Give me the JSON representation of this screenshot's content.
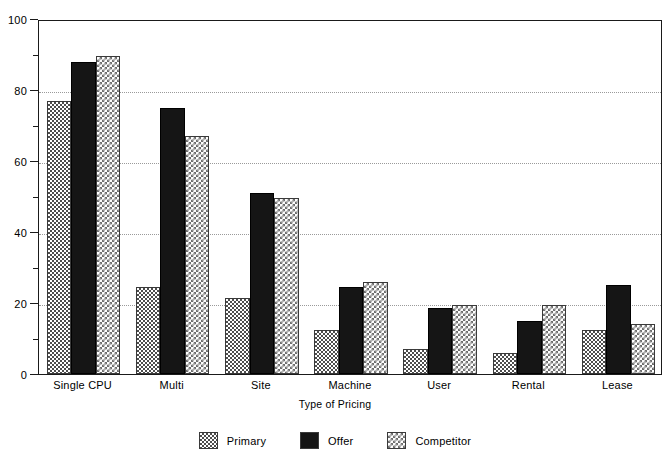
{
  "chart_data": {
    "type": "bar",
    "title": "",
    "xlabel": "Type of Pricing",
    "ylabel": "",
    "categories": [
      "Single CPU",
      "Multi",
      "Site",
      "Machine",
      "User",
      "Rental",
      "Lease"
    ],
    "series": [
      {
        "name": "Primary",
        "pattern": "cross-hatch",
        "color": "#4d4d4d",
        "values": [
          77,
          24.5,
          21.5,
          12.5,
          7,
          6,
          12.5
        ]
      },
      {
        "name": "Offer",
        "pattern": "solid",
        "color": "#151515",
        "values": [
          88,
          75,
          51,
          24.5,
          18.5,
          15,
          25
        ]
      },
      {
        "name": "Competitor",
        "pattern": "diagonal-hatch",
        "color": "#6f6f6f",
        "values": [
          89.5,
          67,
          49.5,
          26,
          19.5,
          19.5,
          14
        ]
      }
    ],
    "ylim": [
      0,
      100
    ],
    "y_ticks_major": [
      0,
      20,
      40,
      60,
      80,
      100
    ],
    "y_ticks_minor": [
      10,
      30,
      50,
      70,
      90
    ],
    "gridlines": [
      20,
      40,
      60,
      80
    ],
    "grid": true,
    "legend_position": "bottom-center"
  },
  "axis": {
    "y_tick_labels": [
      "0",
      "20",
      "40",
      "60",
      "80",
      "100"
    ],
    "x_title": "Type of Pricing"
  },
  "legend": {
    "items": [
      {
        "label": "Primary"
      },
      {
        "label": "Offer"
      },
      {
        "label": "Competitor"
      }
    ]
  }
}
